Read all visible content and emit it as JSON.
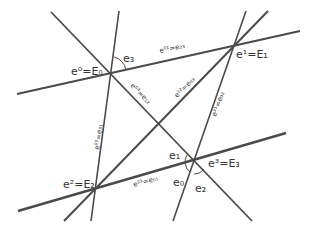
{
  "diagram": {
    "type": "projective-frame-lines",
    "colors": {
      "line": "#4a4a4a",
      "text": "#333333",
      "background": "#ffffff"
    },
    "vertices": [
      {
        "id": "E0",
        "x": 111,
        "y": 73,
        "label": "e⁰=E₀"
      },
      {
        "id": "E1",
        "x": 234,
        "y": 45,
        "label": "e¹=E₁"
      },
      {
        "id": "E2",
        "x": 96,
        "y": 188,
        "label": "e²=E₂"
      },
      {
        "id": "E3",
        "x": 194,
        "y": 161,
        "label": "e³=E₃"
      }
    ],
    "lines": [
      {
        "id": "E0-E1",
        "x1": 17,
        "y1": 94,
        "x2": 300,
        "y2": 31,
        "width": 2.2,
        "label": "e⁰¹=e₂₃"
      },
      {
        "id": "E2-E3",
        "x1": 18,
        "y1": 211,
        "x2": 286,
        "y2": 133,
        "width": 2.4,
        "label": "e²³=e₀₁"
      },
      {
        "id": "E0-E2",
        "x1": 119,
        "y1": 11,
        "x2": 91,
        "y2": 221,
        "width": 1.6,
        "label": "e⁰²=e₃₁"
      },
      {
        "id": "E1-E3",
        "x1": 246,
        "y1": 11,
        "x2": 173,
        "y2": 221,
        "width": 1.6,
        "label": "e³¹=e₀₂"
      },
      {
        "id": "E0-E3",
        "x1": 51,
        "y1": 12,
        "x2": 252,
        "y2": 221,
        "width": 1.8,
        "label": "e⁰³=e₁₂"
      },
      {
        "id": "E2-E1",
        "x1": 64,
        "y1": 221,
        "x2": 268,
        "y2": 11,
        "width": 2.0,
        "label": "e¹²=e₀₃"
      }
    ],
    "angle_labels": [
      {
        "label": "e₃",
        "x": 122,
        "y": 60
      },
      {
        "label": "e₁",
        "x": 170,
        "y": 160
      },
      {
        "label": "e₀",
        "x": 175,
        "y": 185
      },
      {
        "label": "e₂",
        "x": 196,
        "y": 190
      }
    ]
  }
}
